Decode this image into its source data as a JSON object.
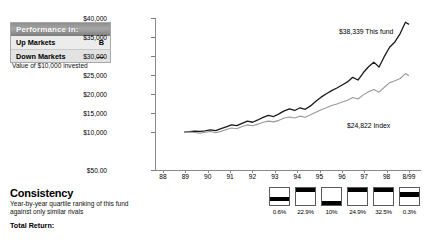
{
  "performance_box": {
    "header": "Performance in:",
    "rows": [
      {
        "label": "Up Markets",
        "grade": "B"
      },
      {
        "label": "Down Markets",
        "grade": "—"
      }
    ],
    "caption": "Value of $10,000 invested"
  },
  "consistency": {
    "title": "Consistency",
    "subtitle": "Year-by-year quartile ranking of this fund against only similar rivals",
    "total_return_label": "Total Return:"
  },
  "chart_data": {
    "type": "line",
    "title": "Value of $10,000 invested",
    "xlabel": "",
    "ylabel": "",
    "grid": false,
    "legend_position": "inline-annotations",
    "ylim": [
      50,
      40000
    ],
    "ytick_labels": [
      "$40,000",
      "$35,000",
      "$30,000",
      "$25,000",
      "$20,000",
      "$15,000",
      "$10,000",
      "$50.00"
    ],
    "ytick_values": [
      40000,
      35000,
      30000,
      25000,
      20000,
      15000,
      10000,
      50
    ],
    "xtick_labels": [
      "88",
      "89",
      "90",
      "91",
      "92",
      "93",
      "94",
      "95",
      "96",
      "97",
      "98",
      "8/99"
    ],
    "annotations": [
      {
        "text": "$38,339 This fund",
        "value": 38339,
        "series": "This fund"
      },
      {
        "text": "$24,822 Index",
        "value": 24822,
        "series": "Index"
      }
    ],
    "series": [
      {
        "name": "This fund",
        "color": "#1a1a1a",
        "end_value": 38339,
        "x": [
          1989.0,
          1989.25,
          1989.5,
          1989.75,
          1990.0,
          1990.25,
          1990.5,
          1990.75,
          1991.0,
          1991.25,
          1991.5,
          1991.75,
          1992.0,
          1992.25,
          1992.5,
          1992.75,
          1993.0,
          1993.25,
          1993.5,
          1993.75,
          1994.0,
          1994.25,
          1994.5,
          1994.75,
          1995.0,
          1995.25,
          1995.5,
          1995.75,
          1996.0,
          1996.25,
          1996.5,
          1996.75,
          1997.0,
          1997.25,
          1997.5,
          1997.75,
          1998.0,
          1998.25,
          1998.5,
          1998.75,
          1999.0,
          1999.25,
          1999.5,
          1999.67
        ],
        "values": [
          10000,
          10150,
          10280,
          10180,
          10350,
          10600,
          10400,
          10900,
          11400,
          11900,
          11700,
          12300,
          12900,
          12600,
          13200,
          13900,
          14400,
          14100,
          14800,
          15600,
          16100,
          15700,
          16400,
          16000,
          16900,
          18100,
          19200,
          20100,
          20900,
          21600,
          22400,
          23200,
          24400,
          23700,
          25600,
          27200,
          28400,
          27100,
          29900,
          32300,
          33700,
          35900,
          38900,
          38339
        ]
      },
      {
        "name": "Index",
        "color": "#9a9a9a",
        "end_value": 24822,
        "x": [
          1989.0,
          1989.25,
          1989.5,
          1989.75,
          1990.0,
          1990.25,
          1990.5,
          1990.75,
          1991.0,
          1991.25,
          1991.5,
          1991.75,
          1992.0,
          1992.25,
          1992.5,
          1992.75,
          1993.0,
          1993.25,
          1993.5,
          1993.75,
          1994.0,
          1994.25,
          1994.5,
          1994.75,
          1995.0,
          1995.25,
          1995.5,
          1995.75,
          1996.0,
          1996.25,
          1996.5,
          1996.75,
          1997.0,
          1997.25,
          1997.5,
          1997.75,
          1998.0,
          1998.25,
          1998.5,
          1998.75,
          1999.0,
          1999.25,
          1999.5,
          1999.67
        ],
        "values": [
          10000,
          10050,
          9900,
          9750,
          9950,
          10150,
          9850,
          10200,
          10700,
          11100,
          10900,
          11500,
          11900,
          11700,
          12100,
          12600,
          12900,
          12700,
          13100,
          13700,
          14000,
          13700,
          14200,
          13900,
          14600,
          15200,
          15900,
          16400,
          17000,
          17400,
          17900,
          18400,
          19100,
          18700,
          19800,
          20600,
          21200,
          20500,
          21800,
          23000,
          23500,
          24100,
          25400,
          24822
        ]
      }
    ]
  },
  "quartiles": {
    "cells": [
      {
        "pct": "0.6%",
        "quartile": 3
      },
      {
        "pct": "22.9%",
        "quartile": 1
      },
      {
        "pct": "10%",
        "quartile": 4
      },
      {
        "pct": "24.9%",
        "quartile": 1
      },
      {
        "pct": "32.5%",
        "quartile": 1
      },
      {
        "pct": "0.3%",
        "quartile": 2
      }
    ]
  },
  "colors": {
    "fund_line": "#1a1a1a",
    "index_line": "#9a9a9a",
    "axis": "#8a8a8a",
    "panel_bg": "#e9e9e9"
  }
}
